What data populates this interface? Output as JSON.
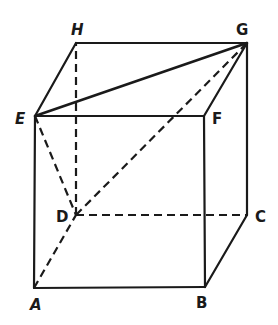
{
  "diagram": {
    "type": "cube",
    "colors": {
      "stroke": "#1a1a1a",
      "background": "#ffffff"
    },
    "vertices": {
      "A": {
        "label": "A",
        "x": 34,
        "y": 288
      },
      "B": {
        "label": "B",
        "x": 205,
        "y": 287
      },
      "C": {
        "label": "C",
        "x": 247,
        "y": 215
      },
      "D": {
        "label": "D",
        "x": 76,
        "y": 215
      },
      "E": {
        "label": "E",
        "x": 35,
        "y": 116
      },
      "F": {
        "label": "F",
        "x": 204,
        "y": 116
      },
      "G": {
        "label": "G",
        "x": 247,
        "y": 43
      },
      "H": {
        "label": "H",
        "x": 76,
        "y": 43
      }
    },
    "solid_edges": [
      "AB",
      "BF",
      "FE",
      "EA",
      "EH",
      "HG",
      "GF",
      "GC",
      "CB",
      "EG"
    ],
    "dashed_edges": [
      "AD",
      "DC",
      "DH",
      "ED",
      "DG"
    ]
  }
}
